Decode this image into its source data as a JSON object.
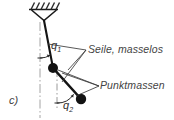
{
  "figure": {
    "part_label": "c)",
    "title_implied": "Doppelpendel",
    "background_color": "#ffffff",
    "ink_color": "#1a1a1a",
    "text_color": "#444444"
  },
  "labels": {
    "ropes": "Seile, masselos",
    "point_masses": "Punktmassen",
    "angle_1_base": "q",
    "angle_1_sub": "1",
    "angle_2_base": "q",
    "angle_2_sub": "2"
  },
  "annotations": [
    {
      "name": "ceiling-hatching",
      "description": "hatched fixed ceiling support"
    },
    {
      "name": "pivot-bracket",
      "description": "triangular pivot bracket"
    },
    {
      "name": "rope-1",
      "description": "upper massless rope from pivot to first point mass"
    },
    {
      "name": "rope-2",
      "description": "lower massless rope from first to second point mass"
    },
    {
      "name": "mass-1",
      "description": "first point mass (filled circle)"
    },
    {
      "name": "mass-2",
      "description": "second point mass (filled circle)"
    },
    {
      "name": "reference-line-1",
      "description": "vertical dash-dot reference through pivot"
    },
    {
      "name": "reference-line-2",
      "description": "vertical dash-dot reference through first mass"
    },
    {
      "name": "angle-arc-1",
      "description": "arc marking angle q1 from vertical to rope 1"
    },
    {
      "name": "angle-arc-2",
      "description": "arc marking angle q2 from vertical to rope 2"
    },
    {
      "name": "leader-seile",
      "description": "leader lines pointing to both ropes"
    },
    {
      "name": "leader-punktmassen",
      "description": "leader lines pointing to both point masses"
    }
  ],
  "geometry": {
    "pivot": {
      "x": 44,
      "y": 20
    },
    "mass_1": {
      "x": 53,
      "y": 68
    },
    "mass_2": {
      "x": 81,
      "y": 99
    },
    "mass_radius": 5.0,
    "reference_x_1": 40,
    "reference_x_2": 57
  }
}
